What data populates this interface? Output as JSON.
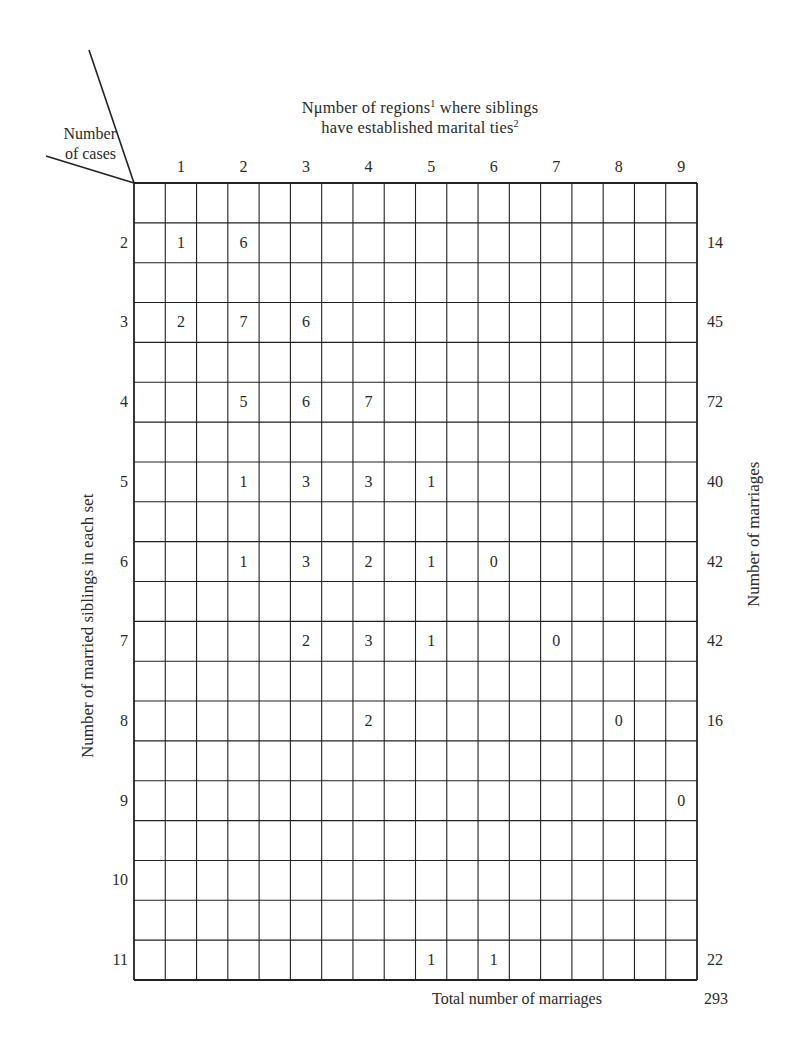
{
  "chart_data": {
    "type": "table",
    "title_line1_prefix": "Nμmber of regions",
    "title_line1_sup": "1",
    "title_line1_suffix": " where siblings",
    "title_line2": "have established marital ties",
    "title_line2_sup": "2",
    "corner_label_line1": "Number",
    "corner_label_line2": "of cases",
    "xlabel": "Number of regions where siblings have established marital ties",
    "ylabel": "Number of married siblings in each set",
    "right_label": "Number of marriages",
    "column_labels": [
      "1",
      "2",
      "3",
      "4",
      "5",
      "6",
      "7",
      "8",
      "9"
    ],
    "row_labels": [
      "2",
      "3",
      "4",
      "5",
      "6",
      "7",
      "8",
      "9",
      "10",
      "11"
    ],
    "cells": [
      {
        "row": "2",
        "col": "1",
        "value": 1
      },
      {
        "row": "2",
        "col": "2",
        "value": 6
      },
      {
        "row": "3",
        "col": "1",
        "value": 2
      },
      {
        "row": "3",
        "col": "2",
        "value": 7
      },
      {
        "row": "3",
        "col": "3",
        "value": 6
      },
      {
        "row": "4",
        "col": "2",
        "value": 5
      },
      {
        "row": "4",
        "col": "3",
        "value": 6
      },
      {
        "row": "4",
        "col": "4",
        "value": 7
      },
      {
        "row": "5",
        "col": "2",
        "value": 1
      },
      {
        "row": "5",
        "col": "3",
        "value": 3
      },
      {
        "row": "5",
        "col": "4",
        "value": 3
      },
      {
        "row": "5",
        "col": "5",
        "value": 1
      },
      {
        "row": "6",
        "col": "2",
        "value": 1
      },
      {
        "row": "6",
        "col": "3",
        "value": 3
      },
      {
        "row": "6",
        "col": "4",
        "value": 2
      },
      {
        "row": "6",
        "col": "5",
        "value": 1
      },
      {
        "row": "6",
        "col": "6",
        "value": 0
      },
      {
        "row": "7",
        "col": "3",
        "value": 2
      },
      {
        "row": "7",
        "col": "4",
        "value": 3
      },
      {
        "row": "7",
        "col": "5",
        "value": 1
      },
      {
        "row": "7",
        "col": "7",
        "value": 0
      },
      {
        "row": "8",
        "col": "4",
        "value": 2
      },
      {
        "row": "8",
        "col": "8",
        "value": 0
      },
      {
        "row": "9",
        "col": "9",
        "value": 0
      },
      {
        "row": "11",
        "col": "5",
        "value": 1
      },
      {
        "row": "11",
        "col": "6",
        "value": 1
      }
    ],
    "row_totals": [
      {
        "row": "2",
        "value": "14"
      },
      {
        "row": "3",
        "value": "45"
      },
      {
        "row": "4",
        "value": "72"
      },
      {
        "row": "5",
        "value": "40"
      },
      {
        "row": "6",
        "value": "42"
      },
      {
        "row": "7",
        "value": "42"
      },
      {
        "row": "8",
        "value": "16"
      },
      {
        "row": "11",
        "value": "22"
      }
    ],
    "grand_total_label": "Total number of marriages",
    "grand_total": "293",
    "grid": {
      "columns": 18,
      "rows": 20,
      "on": true
    }
  }
}
